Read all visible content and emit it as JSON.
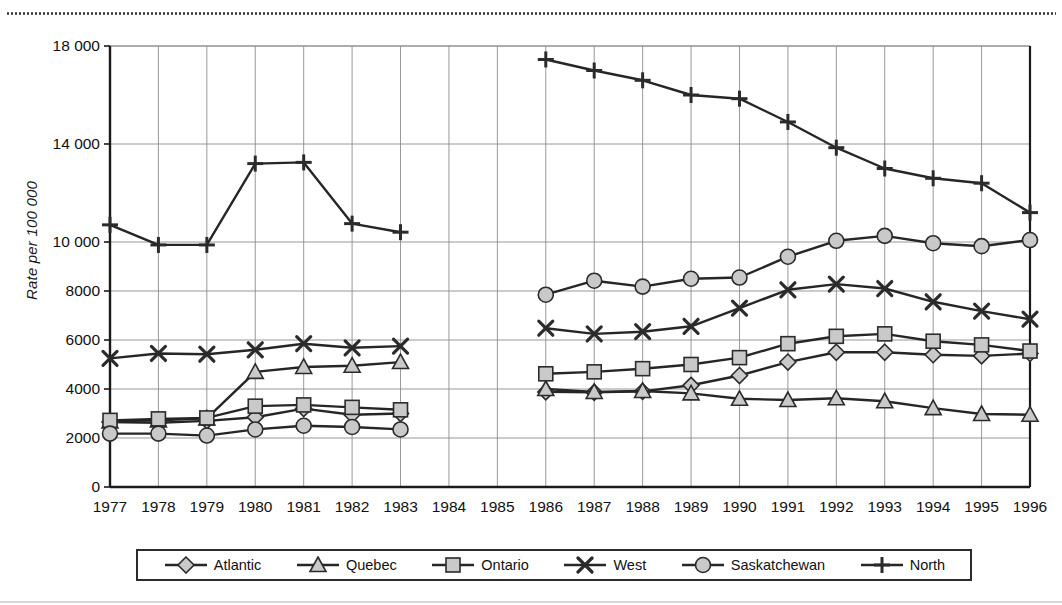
{
  "chart_data": {
    "type": "line",
    "title": "",
    "xlabel": "",
    "ylabel": "Rate per 100 000",
    "ylim": [
      0,
      18000
    ],
    "yticks": [
      0,
      2000,
      4000,
      6000,
      8000,
      10000,
      14000,
      18000
    ],
    "ytick_labels": [
      "0",
      "2000",
      "4000",
      "6000",
      "8000",
      "10 000",
      "14 000",
      "18 000"
    ],
    "grid": true,
    "legend_position": "bottom",
    "x": [
      1977,
      1978,
      1979,
      1980,
      1981,
      1982,
      1983,
      1984,
      1985,
      1986,
      1987,
      1988,
      1989,
      1990,
      1991,
      1992,
      1993,
      1994,
      1995,
      1996
    ],
    "xtick_labels": [
      "1977",
      "1978",
      "1979",
      "1980",
      "1981",
      "1982",
      "1983",
      "1984",
      "1985",
      "1986",
      "1987",
      "1988",
      "1989",
      "1990",
      "1991",
      "1992",
      "1993",
      "1994",
      "1995",
      "1996"
    ],
    "series": [
      {
        "name": "Atlantic",
        "marker": "diamond",
        "values": [
          2650,
          2620,
          2700,
          2850,
          3200,
          2950,
          3000,
          null,
          null,
          3880,
          3860,
          3900,
          4150,
          4550,
          5100,
          5500,
          5500,
          5400,
          5350,
          5450
        ]
      },
      {
        "name": "Quebec",
        "marker": "triangle",
        "values": [
          2680,
          2720,
          2800,
          4700,
          4900,
          4950,
          5100,
          null,
          null,
          4000,
          3880,
          3920,
          3820,
          3600,
          3550,
          3620,
          3500,
          3220,
          2980,
          2950
        ]
      },
      {
        "name": "Ontario",
        "marker": "square",
        "values": [
          2720,
          2780,
          2820,
          3300,
          3350,
          3250,
          3150,
          null,
          null,
          4620,
          4700,
          4830,
          5000,
          5280,
          5850,
          6150,
          6250,
          5950,
          5800,
          5550
        ]
      },
      {
        "name": "West",
        "marker": "x",
        "values": [
          5250,
          5450,
          5420,
          5600,
          5850,
          5680,
          5750,
          null,
          null,
          6480,
          6250,
          6340,
          6560,
          7300,
          8050,
          8280,
          8100,
          7560,
          7180,
          6850
        ]
      },
      {
        "name": "Saskatchewan",
        "marker": "circle",
        "values": [
          2180,
          2180,
          2100,
          2350,
          2500,
          2450,
          2350,
          null,
          null,
          7850,
          8420,
          8180,
          8500,
          8550,
          9400,
          10050,
          10250,
          9950,
          9830,
          10080
        ]
      },
      {
        "name": "North",
        "marker": "plus",
        "values": [
          10700,
          9880,
          9880,
          13200,
          13250,
          10750,
          10400,
          null,
          null,
          17450,
          17000,
          16600,
          16000,
          15850,
          14900,
          13850,
          13000,
          12600,
          12400,
          11200
        ]
      }
    ]
  },
  "legend": {
    "items": [
      {
        "label": "Atlantic",
        "marker": "diamond"
      },
      {
        "label": "Quebec",
        "marker": "triangle"
      },
      {
        "label": "Ontario",
        "marker": "square"
      },
      {
        "label": "West",
        "marker": "x"
      },
      {
        "label": "Saskatchewan",
        "marker": "circle"
      },
      {
        "label": "North",
        "marker": "plus"
      }
    ]
  },
  "colors": {
    "line": "#262626",
    "marker_fill": "#c9c9c9",
    "marker_stroke": "#2b2b2b",
    "grid": "#8d8d8d",
    "axis": "#1a1a1a",
    "text": "#111111",
    "top_rule": "#3a3a3a"
  }
}
